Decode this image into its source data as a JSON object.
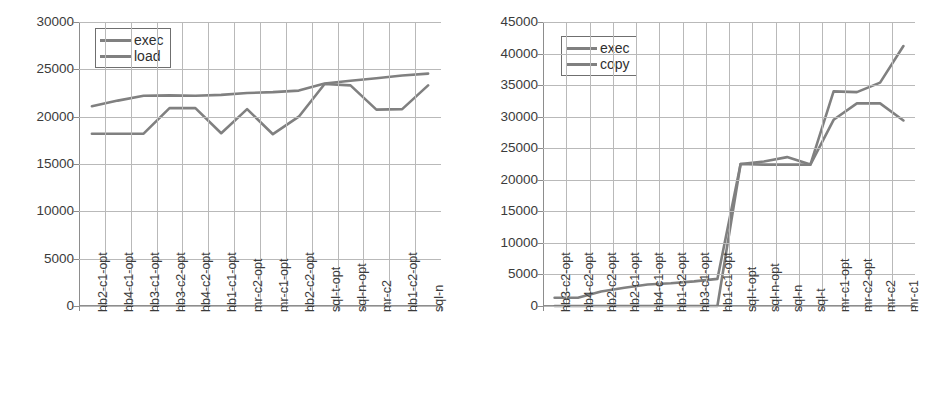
{
  "chart_data": [
    {
      "id": "left",
      "type": "line",
      "title": "",
      "xlabel": "",
      "ylabel": "",
      "ylim": [
        0,
        30000
      ],
      "yticks": [
        0,
        5000,
        10000,
        15000,
        20000,
        25000,
        30000
      ],
      "ytick_labels": [
        "0",
        "5000",
        "10000",
        "15000",
        "20000",
        "25000",
        "30000"
      ],
      "grid": true,
      "legend_position": "top-left",
      "legend": [
        "exec",
        "load"
      ],
      "line_color": "#808080",
      "categories": [
        "hb2-c1-opt",
        "hb4-c1-opt",
        "hb3-c1-opt",
        "hb3-c2-opt",
        "hb4-c2-opt",
        "hb1-c1-opt",
        "mr-c2-opt",
        "mr-c1-opt",
        "hb2-c2-opt",
        "sql-t-opt",
        "sql-n-opt",
        "mr-c2",
        "hb1-c2-opt",
        "sql-n"
      ],
      "series": [
        {
          "name": "exec",
          "values": [
            21100,
            21700,
            22200,
            22250,
            22200,
            22300,
            22500,
            22600,
            22750,
            23500,
            23800,
            24050,
            24350,
            24550
          ]
        },
        {
          "name": "load",
          "values": [
            18200,
            18200,
            18200,
            20900,
            20900,
            18250,
            20800,
            18150,
            20000,
            23450,
            23300,
            20750,
            20800,
            23300
          ]
        }
      ]
    },
    {
      "id": "right",
      "type": "line",
      "title": "",
      "xlabel": "",
      "ylabel": "",
      "ylim": [
        0,
        45000
      ],
      "yticks": [
        0,
        5000,
        10000,
        15000,
        20000,
        25000,
        30000,
        35000,
        40000,
        45000
      ],
      "ytick_labels": [
        "0",
        "5000",
        "10000",
        "15000",
        "20000",
        "25000",
        "30000",
        "35000",
        "40000",
        "45000"
      ],
      "grid": true,
      "legend_position": "top-left",
      "legend": [
        "exec",
        "copy"
      ],
      "line_color": "#808080",
      "categories": [
        "hb3-c2-opt",
        "hb4-c2-opt",
        "hb2-c2-opt",
        "hb2-c1-opt",
        "hb4-c1-opt",
        "hb1-c2-opt",
        "hb3-c1-opt",
        "hb1-c1-opt",
        "sql-t-opt",
        "sql-n-opt",
        "sql-n",
        "sql-t",
        "mr-c1-opt",
        "mr-c2-opt",
        "mr-c2",
        "mr-c1"
      ],
      "series": [
        {
          "name": "exec",
          "values": [
            1300,
            1300,
            2300,
            2900,
            3400,
            3600,
            3900,
            4300,
            22500,
            22900,
            23600,
            22400,
            34000,
            33900,
            35400,
            41200
          ]
        },
        {
          "name": "copy",
          "values": [
            0,
            0,
            0,
            0,
            0,
            0,
            0,
            0,
            22500,
            22400,
            22400,
            22400,
            29500,
            32100,
            32100,
            29400
          ]
        }
      ]
    }
  ]
}
